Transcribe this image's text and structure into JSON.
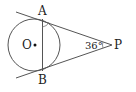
{
  "diagram": {
    "type": "geometry",
    "points": {
      "A": {
        "label": "A",
        "x": 43,
        "y": 19
      },
      "B": {
        "label": "B",
        "x": 43,
        "y": 71
      },
      "O": {
        "label": "O",
        "x": 34,
        "y": 45
      },
      "P": {
        "label": "P",
        "x": 112,
        "y": 45
      }
    },
    "circle": {
      "center": "O",
      "cx": 34,
      "cy": 45,
      "r": 26
    },
    "angle_P": {
      "label": "36°",
      "value_deg": 36
    },
    "marks": [
      "angle arc at A between tangent PA and chord AB",
      "angle arc at P"
    ],
    "colors": {
      "stroke": "#555555",
      "text": "#222222",
      "background": "#ffffff"
    }
  }
}
